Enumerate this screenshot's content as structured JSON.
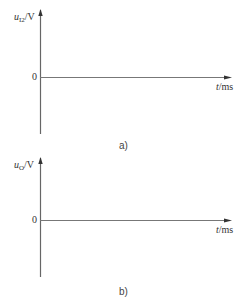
{
  "figure": {
    "panels": [
      {
        "id": "a",
        "caption": "a)",
        "y_axis": {
          "var": "u",
          "sub": "I2",
          "unit": "/V"
        },
        "x_axis": {
          "var": "t",
          "unit": "/ms"
        },
        "origin_label": "0"
      },
      {
        "id": "b",
        "caption": "b)",
        "y_axis": {
          "var": "u",
          "sub": "O",
          "unit": "/V"
        },
        "x_axis": {
          "var": "t",
          "unit": "/ms"
        },
        "origin_label": "0"
      }
    ]
  },
  "colors": {
    "axis": "#555555",
    "text": "#333333"
  }
}
